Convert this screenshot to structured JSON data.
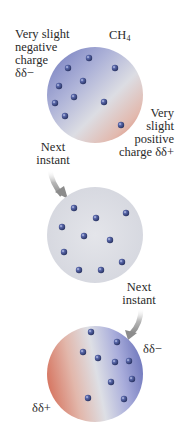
{
  "diagram": {
    "molecule": {
      "formula": "CH",
      "subscript": "4"
    },
    "stage1": {
      "negative_label": [
        "Very slight",
        "negative",
        "charge",
        "δδ−"
      ],
      "positive_label": [
        "Very",
        "slight",
        "positive",
        "charge δδ+"
      ],
      "circle": {
        "cx": 95,
        "cy": 95,
        "r": 48,
        "gradient": "blue-upper-left-to-red-lower-right"
      },
      "electrons": [
        [
          89,
          58
        ],
        [
          68,
          68
        ],
        [
          115,
          68
        ],
        [
          83,
          81
        ],
        [
          59,
          86
        ],
        [
          74,
          97
        ],
        [
          104,
          102
        ],
        [
          55,
          103
        ],
        [
          65,
          116
        ],
        [
          121,
          125
        ]
      ]
    },
    "transition1": {
      "label": [
        "Next",
        "instant"
      ]
    },
    "stage2": {
      "circle": {
        "cx": 95,
        "cy": 235,
        "r": 48,
        "gradient": "uniform-neutral"
      },
      "electrons": [
        [
          74,
          208
        ],
        [
          96,
          218
        ],
        [
          126,
          213
        ],
        [
          62,
          227
        ],
        [
          84,
          236
        ],
        [
          110,
          240
        ],
        [
          64,
          252
        ],
        [
          122,
          262
        ],
        [
          79,
          270
        ],
        [
          101,
          270
        ]
      ]
    },
    "transition2": {
      "label": [
        "Next",
        "instant"
      ]
    },
    "stage3": {
      "negative_label": "δδ−",
      "positive_label": "δδ+",
      "circle": {
        "cx": 95,
        "cy": 374,
        "r": 48,
        "gradient": "red-left-to-blue-right"
      },
      "electrons": [
        [
          91,
          332
        ],
        [
          117,
          342
        ],
        [
          83,
          352
        ],
        [
          98,
          358
        ],
        [
          115,
          362
        ],
        [
          129,
          361
        ],
        [
          111,
          382
        ],
        [
          132,
          379
        ],
        [
          88,
          398
        ],
        [
          124,
          399
        ]
      ]
    },
    "colors": {
      "negative_blue": "#7e86c4",
      "positive_red": "#d8826e",
      "neutral": "#dcdee6",
      "electron": "#3c4a8c",
      "arrow": "#9a9a9a",
      "text": "#2a2a2a"
    }
  }
}
